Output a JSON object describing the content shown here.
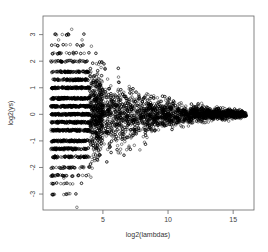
{
  "chart_data": {
    "type": "scatter",
    "title": "",
    "xlabel": "log2(lambdas)",
    "ylabel": "log2(ys)",
    "xlim": [
      0.4,
      16.6
    ],
    "ylim": [
      -3.6,
      3.7
    ],
    "x_ticks": [
      5,
      10,
      15
    ],
    "x_tick_labels": [
      "5",
      "10",
      "15"
    ],
    "y_ticks": [
      -3,
      -2,
      -1,
      0,
      1,
      2,
      3
    ],
    "y_tick_labels": [
      "-3",
      "-2",
      "-1",
      "0",
      "1",
      "2",
      "3"
    ],
    "grid": false,
    "legend": null,
    "marker": "open-circle",
    "marker_color": "#000000",
    "point_model": {
      "count": 5000,
      "x_range": [
        1,
        16
      ],
      "spread_sd_at_x": [
        [
          1,
          1.3
        ],
        [
          3,
          1.1
        ],
        [
          5,
          0.7
        ],
        [
          7,
          0.45
        ],
        [
          10,
          0.25
        ],
        [
          13,
          0.12
        ],
        [
          16,
          0.05
        ]
      ],
      "discrete_band_levels": [
        -3,
        -2.6,
        -2.3,
        -2,
        -1.6,
        -1.3,
        -1,
        -0.6,
        -0.3,
        0,
        0.3,
        0.6,
        1,
        1.3,
        1.6,
        2,
        2.3,
        2.6,
        3
      ],
      "discrete_below_x": 4
    },
    "notable_points": [
      {
        "x": 2.6,
        "y": 3.2
      },
      {
        "x": 1.6,
        "y": 2.8
      },
      {
        "x": 3.4,
        "y": 2.8
      },
      {
        "x": 3.0,
        "y": -3.5
      },
      {
        "x": 2.0,
        "y": -2.4
      },
      {
        "x": 6.2,
        "y": 1.4
      },
      {
        "x": 7.0,
        "y": -1.2
      }
    ]
  }
}
